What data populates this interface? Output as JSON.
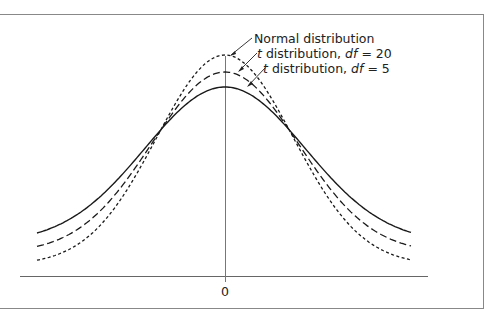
{
  "chart_data": {
    "type": "line",
    "title": "",
    "xlabel": "",
    "ylabel": "",
    "x_ticks": [
      "0"
    ],
    "grid": false,
    "legend_position": "annotations",
    "series": [
      {
        "name": "Normal distribution",
        "style": "dotted",
        "df": null,
        "peak_density": 0.399
      },
      {
        "name": "t distribution, df = 20",
        "style": "dashed",
        "df": 20,
        "peak_density": 0.394
      },
      {
        "name": "t distribution, df = 5",
        "style": "solid",
        "df": 5,
        "peak_density": 0.38
      }
    ],
    "annotations": [
      {
        "text_prefix": "",
        "text_italic": "",
        "text": "Normal distribution",
        "series": 0
      },
      {
        "text_prefix": "t",
        "text": " distribution, ",
        "text_italic": "df",
        "text_suffix": " = 20",
        "series": 1
      },
      {
        "text_prefix": "t",
        "text": " distribution, ",
        "text_italic": "df",
        "text_suffix": " = 5",
        "series": 2
      }
    ]
  },
  "colors": {
    "curve": "#1a1a1a",
    "axis": "#666666",
    "frame": "#888888"
  },
  "axis": {
    "zero_label": "0"
  }
}
